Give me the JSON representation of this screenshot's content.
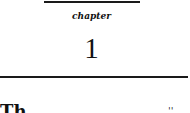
{
  "heading": {
    "label": "chapter",
    "number": "1"
  },
  "body": {
    "fragment_left": "Th",
    "fragment_right": "''"
  }
}
